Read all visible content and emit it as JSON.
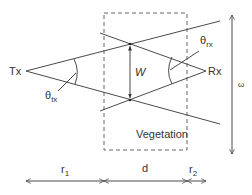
{
  "diagram": {
    "title": "",
    "labels": {
      "tx": "Tx",
      "rx": "Rx",
      "width": "W",
      "omega": "ω",
      "vegetation": "Vegetation",
      "theta_tx_main": "θ",
      "theta_tx_sub": "tx",
      "theta_rx_main": "θ",
      "theta_rx_sub": "rx",
      "r1_main": "r",
      "r1_sub": "1",
      "d": "d",
      "r2_main": "r",
      "r2_sub": "2"
    },
    "colors": {
      "line": "#4a4a4a",
      "dashed_box": "#666666",
      "text": "#333333",
      "background": "#ffffff"
    },
    "nodes": [
      {
        "id": "tx",
        "label": "Tx",
        "x": 26,
        "y": 71
      },
      {
        "id": "rx",
        "label": "Rx",
        "x": 206,
        "y": 71
      }
    ],
    "regions": [
      {
        "id": "vegetation",
        "label": "Vegetation",
        "style": "dashed",
        "x": 104,
        "y": 13,
        "w": 83,
        "h": 137
      }
    ],
    "dimensions": [
      {
        "id": "r1",
        "label": "r1",
        "from": 26,
        "to": 104
      },
      {
        "id": "d",
        "label": "d",
        "from": 104,
        "to": 187
      },
      {
        "id": "r2",
        "label": "r2",
        "from": 187,
        "to": 206
      },
      {
        "id": "omega",
        "label": "ω",
        "orientation": "vertical"
      },
      {
        "id": "W",
        "label": "W",
        "orientation": "vertical"
      }
    ]
  }
}
